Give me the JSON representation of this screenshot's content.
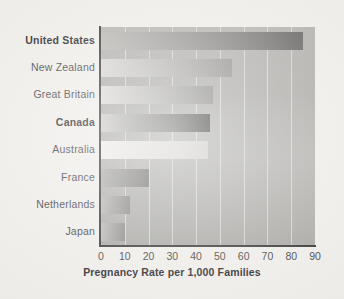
{
  "chart_data": {
    "type": "bar",
    "orientation": "horizontal",
    "title": "",
    "xlabel": "Pregnancy Rate per 1,000 Families",
    "ylabel": "",
    "xlim": [
      0,
      90
    ],
    "xticks": [
      "0",
      "10",
      "20",
      "30",
      "40",
      "50",
      "60",
      "70",
      "80",
      "90"
    ],
    "grid": "vertical",
    "legend": "none",
    "categories": [
      "United States",
      "New Zealand",
      "Great Britain",
      "Canada",
      "Australia",
      "France",
      "Netherlands",
      "Japan"
    ],
    "values": [
      85,
      55,
      47,
      46,
      45,
      20,
      12,
      10
    ],
    "emphasized": [
      "United States",
      "Canada"
    ],
    "bars": [
      {
        "label": "United States",
        "value": 85,
        "bold": true,
        "gradient_from": "#b4b3af",
        "gradient_to": "#5d5c5a"
      },
      {
        "label": "New Zealand",
        "value": 55,
        "bold": false,
        "gradient_from": "#d3d2ce",
        "gradient_to": "#8a8987"
      },
      {
        "label": "Great Britain",
        "value": 47,
        "bold": false,
        "gradient_from": "#d9d8d4",
        "gradient_to": "#83827f"
      },
      {
        "label": "Canada",
        "value": 46,
        "bold": true,
        "gradient_from": "#c9c8c4",
        "gradient_to": "#3a3937"
      },
      {
        "label": "Australia",
        "value": 45,
        "bold": false,
        "gradient_from": "#eceae6",
        "gradient_to": "#c8c7c3"
      },
      {
        "label": "France",
        "value": 20,
        "bold": false,
        "gradient_from": "#a7a6a3",
        "gradient_to": "#6a6967"
      },
      {
        "label": "Netherlands",
        "value": 12,
        "bold": false,
        "gradient_from": "#b3b2ae",
        "gradient_to": "#7e7d7a"
      },
      {
        "label": "Japan",
        "value": 10,
        "bold": false,
        "gradient_from": "#b6b5b1",
        "gradient_to": "#828180"
      }
    ]
  },
  "colors": {
    "page_background": "#edebe7",
    "plot_background": "#a9a8a4",
    "axis": "#2c2b29",
    "gridline": "#d9d8d3",
    "text": "#37363a"
  }
}
